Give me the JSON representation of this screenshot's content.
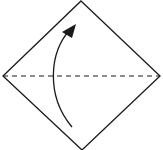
{
  "diagram": {
    "type": "origami-fold",
    "shape": "square-diamond",
    "fold_line": "valley-fold-horizontal",
    "arrow": "fold-bottom-up",
    "colors": {
      "line": "#1a1a1a",
      "background": "#ffffff"
    }
  }
}
